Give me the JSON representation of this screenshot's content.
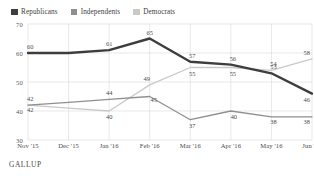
{
  "header": {
    "cropped_headline": ""
  },
  "legend": {
    "position": "top-left",
    "items": [
      {
        "label": "Republicans",
        "color": "#3d3d3d"
      },
      {
        "label": "Independents",
        "color": "#8f8f8f"
      },
      {
        "label": "Democrats",
        "color": "#c9c9c9"
      }
    ]
  },
  "source": "GALLUP",
  "chart_data": {
    "type": "line",
    "title": "",
    "subtitle": "",
    "xlabel": "",
    "ylabel": "",
    "ylim": [
      30,
      70
    ],
    "yticks": [
      70,
      60,
      50,
      40,
      30
    ],
    "grid": true,
    "legend_position": "top-left",
    "categories": [
      "Nov '15",
      "Dec '15",
      "Jan '16",
      "Feb '16",
      "Mar '16",
      "Apr '16",
      "May '16",
      "Jun '16"
    ],
    "series": [
      {
        "name": "Republicans",
        "color": "#3d3d3d",
        "values": [
          60,
          60,
          61,
          65,
          57,
          56,
          53,
          46
        ],
        "labels": [
          "60",
          "",
          "61",
          "65",
          "57",
          "56",
          "53",
          "46"
        ]
      },
      {
        "name": "Independents",
        "color": "#8f8f8f",
        "values": [
          42,
          43,
          44,
          45,
          37,
          40,
          38,
          38
        ],
        "labels": [
          "42",
          "",
          "44",
          "45",
          "37",
          "40",
          "38",
          "38"
        ]
      },
      {
        "name": "Democrats",
        "color": "#c9c9c9",
        "values": [
          42,
          41,
          40,
          49,
          55,
          55,
          54,
          58
        ],
        "labels": [
          "42",
          "",
          "40",
          "49",
          "55",
          "55",
          "54",
          "58"
        ]
      }
    ]
  }
}
